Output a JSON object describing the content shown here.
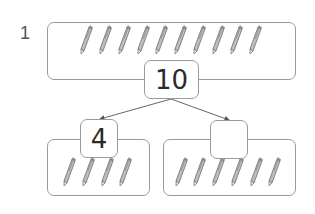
{
  "question": {
    "number": "1",
    "whole": {
      "value": "10",
      "pencil_count": 10
    },
    "parts": [
      {
        "value": "4",
        "pencil_count": 4
      },
      {
        "value": "",
        "pencil_count": 6
      }
    ]
  },
  "colors": {
    "frame_border": "#9a9a9a",
    "arrow": "#555555",
    "pencil_body": "#8a8a8a",
    "text": "#2a2a2a"
  }
}
